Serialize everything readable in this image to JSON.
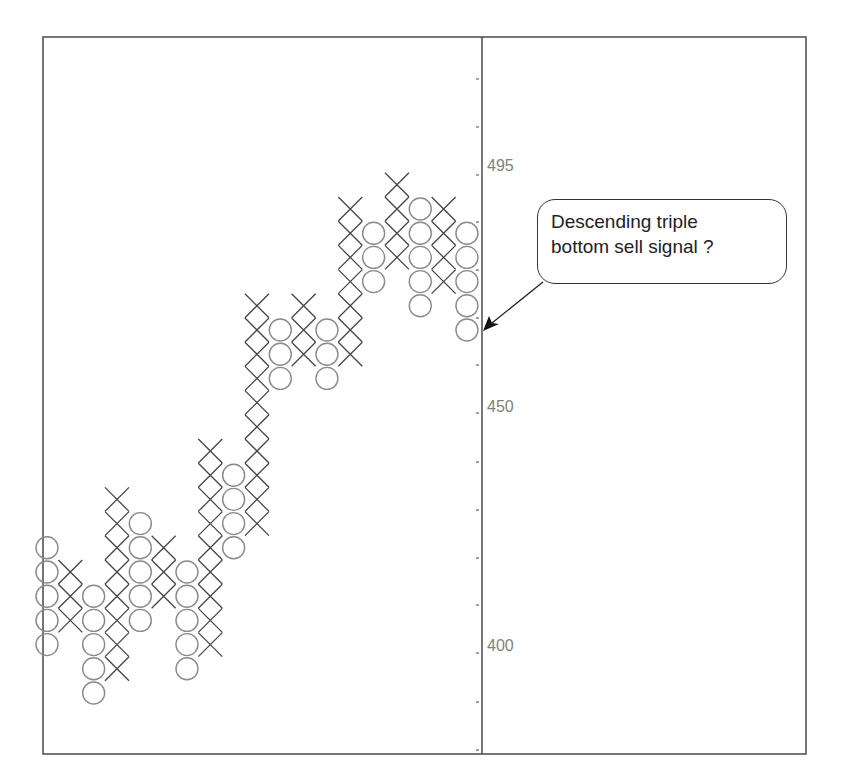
{
  "chart_data": {
    "type": "point_and_figure",
    "title": "",
    "xlabel": "",
    "ylabel": "",
    "y_axis": {
      "position": "right-of-plot",
      "tick_labels": [
        {
          "label": "495",
          "y_px": 166
        },
        {
          "label": "450",
          "y_px": 407
        },
        {
          "label": "400",
          "y_px": 646
        }
      ],
      "tick_y_px": [
        79,
        127,
        175,
        222,
        270,
        318,
        365,
        413,
        462,
        510,
        558,
        605,
        653,
        702,
        750
      ]
    },
    "grid": false,
    "legend": null,
    "box_rows_note": "row 0 = lowest box; each row is one box (~24px)",
    "columns": [
      {
        "type": "O",
        "from_row": 2,
        "to_row": 6
      },
      {
        "type": "X",
        "from_row": 3,
        "to_row": 5
      },
      {
        "type": "O",
        "from_row": 0,
        "to_row": 4
      },
      {
        "type": "X",
        "from_row": 1,
        "to_row": 8
      },
      {
        "type": "O",
        "from_row": 3,
        "to_row": 7
      },
      {
        "type": "X",
        "from_row": 4,
        "to_row": 6
      },
      {
        "type": "O",
        "from_row": 1,
        "to_row": 5
      },
      {
        "type": "X",
        "from_row": 2,
        "to_row": 10
      },
      {
        "type": "O",
        "from_row": 6,
        "to_row": 9
      },
      {
        "type": "X",
        "from_row": 7,
        "to_row": 16
      },
      {
        "type": "O",
        "from_row": 13,
        "to_row": 15
      },
      {
        "type": "X",
        "from_row": 14,
        "to_row": 16
      },
      {
        "type": "O",
        "from_row": 13,
        "to_row": 15
      },
      {
        "type": "X",
        "from_row": 14,
        "to_row": 20
      },
      {
        "type": "O",
        "from_row": 17,
        "to_row": 19
      },
      {
        "type": "X",
        "from_row": 18,
        "to_row": 21
      },
      {
        "type": "O",
        "from_row": 16,
        "to_row": 20
      },
      {
        "type": "X",
        "from_row": 17,
        "to_row": 20
      },
      {
        "type": "O",
        "from_row": 15,
        "to_row": 19
      }
    ],
    "annotations": [
      {
        "text_line1": "Descending triple",
        "text_line2": "bottom sell signal ?",
        "points_to": "last O column low"
      }
    ]
  },
  "callout": {
    "line1": "Descending triple",
    "line2": "bottom sell signal ?"
  },
  "axis_labels": {
    "l495": "495",
    "l450": "450",
    "l400": "400"
  },
  "colors": {
    "x_mark": "#444444",
    "o_mark": "#8a8a8a",
    "frame": "#444444",
    "axis_text": "#808080"
  }
}
